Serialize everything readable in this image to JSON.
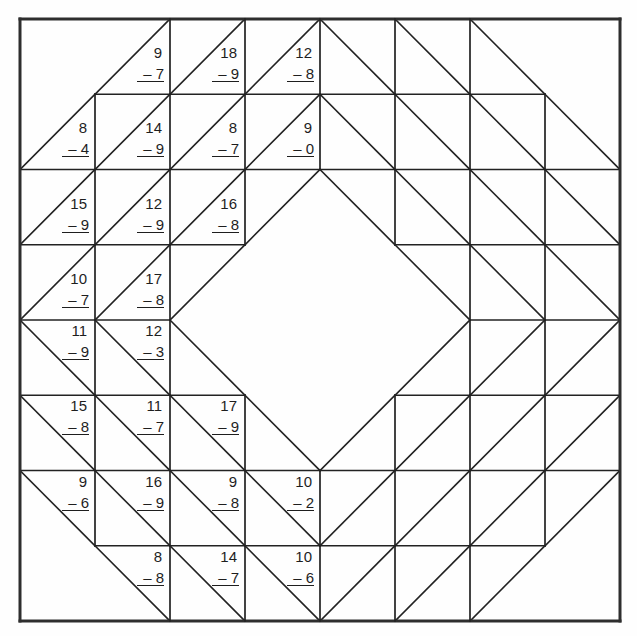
{
  "worksheet": {
    "title": "Subtraction quilt block",
    "colors": {
      "line": "#222222",
      "border": "#2e2e2e",
      "text": "#1e1e1e",
      "paper": "#fefefe"
    },
    "grid": {
      "cols": 8,
      "rows": 8,
      "origin_x": 20,
      "origin_y": 19,
      "cell_w": 75,
      "cell_h": 75.25,
      "horizontal_segments": [
        [
          0,
          0,
          8
        ],
        [
          1,
          1,
          7
        ],
        [
          2,
          0,
          8
        ],
        [
          3,
          0,
          3
        ],
        [
          3,
          5,
          8
        ],
        [
          4,
          0,
          2
        ],
        [
          4,
          6,
          8
        ],
        [
          5,
          0,
          3
        ],
        [
          5,
          5,
          8
        ],
        [
          6,
          0,
          8
        ],
        [
          7,
          1,
          7
        ],
        [
          8,
          0,
          8
        ]
      ],
      "vertical_segments": [
        [
          0,
          0,
          8
        ],
        [
          1,
          1,
          7
        ],
        [
          2,
          0,
          8
        ],
        [
          3,
          0,
          3
        ],
        [
          3,
          5,
          8
        ],
        [
          4,
          0,
          2
        ],
        [
          4,
          6,
          8
        ],
        [
          5,
          0,
          3
        ],
        [
          5,
          5,
          8
        ],
        [
          6,
          0,
          8
        ],
        [
          7,
          1,
          7
        ],
        [
          8,
          0,
          8
        ]
      ],
      "diagonals": [
        [
          "",
          "/",
          "/",
          "/",
          "\\",
          "\\",
          "\\",
          ""
        ],
        [
          "/",
          "/",
          "/",
          "/",
          "\\",
          "\\",
          "\\",
          "\\"
        ],
        [
          "/",
          "/",
          "/",
          "/",
          "\\",
          "\\",
          "\\",
          "\\"
        ],
        [
          "/",
          "/",
          "/",
          "",
          "",
          "\\",
          "\\",
          "\\"
        ],
        [
          "\\",
          "\\",
          "\\",
          "",
          "",
          "/",
          "/",
          "/"
        ],
        [
          "\\",
          "\\",
          "\\",
          "\\",
          "/",
          "/",
          "/",
          "/"
        ],
        [
          "\\",
          "\\",
          "\\",
          "\\",
          "/",
          "/",
          "/",
          "/"
        ],
        [
          "",
          "\\",
          "\\",
          "\\",
          "/",
          "/",
          "/",
          ""
        ]
      ]
    },
    "problems": [
      {
        "row": 0,
        "col": 1,
        "minuend": "9",
        "subtrahend": "– 7",
        "pos": "tl"
      },
      {
        "row": 0,
        "col": 2,
        "minuend": "18",
        "subtrahend": "– 9",
        "pos": "tl"
      },
      {
        "row": 0,
        "col": 3,
        "minuend": "12",
        "subtrahend": "– 8",
        "pos": "tl"
      },
      {
        "row": 1,
        "col": 0,
        "minuend": "8",
        "subtrahend": "– 4",
        "pos": "tl"
      },
      {
        "row": 1,
        "col": 1,
        "minuend": "14",
        "subtrahend": "– 9",
        "pos": "tl"
      },
      {
        "row": 1,
        "col": 2,
        "minuend": "8",
        "subtrahend": "– 7",
        "pos": "tl"
      },
      {
        "row": 1,
        "col": 3,
        "minuend": "9",
        "subtrahend": "– 0",
        "pos": "tl"
      },
      {
        "row": 2,
        "col": 0,
        "minuend": "15",
        "subtrahend": "– 9",
        "pos": "tl"
      },
      {
        "row": 2,
        "col": 1,
        "minuend": "12",
        "subtrahend": "– 9",
        "pos": "tl"
      },
      {
        "row": 2,
        "col": 2,
        "minuend": "16",
        "subtrahend": "– 8",
        "pos": "tl"
      },
      {
        "row": 3,
        "col": 0,
        "minuend": "10",
        "subtrahend": "– 7",
        "pos": "tl"
      },
      {
        "row": 3,
        "col": 1,
        "minuend": "17",
        "subtrahend": "– 8",
        "pos": "tl"
      },
      {
        "row": 4,
        "col": 0,
        "minuend": "11",
        "subtrahend": "– 9",
        "pos": "bl"
      },
      {
        "row": 4,
        "col": 1,
        "minuend": "12",
        "subtrahend": "– 3",
        "pos": "bl"
      },
      {
        "row": 5,
        "col": 0,
        "minuend": "15",
        "subtrahend": "– 8",
        "pos": "bl"
      },
      {
        "row": 5,
        "col": 1,
        "minuend": "11",
        "subtrahend": "– 7",
        "pos": "bl"
      },
      {
        "row": 5,
        "col": 2,
        "minuend": "17",
        "subtrahend": "– 9",
        "pos": "bl"
      },
      {
        "row": 6,
        "col": 0,
        "minuend": "9",
        "subtrahend": "– 6",
        "pos": "bl"
      },
      {
        "row": 6,
        "col": 1,
        "minuend": "16",
        "subtrahend": "– 9",
        "pos": "bl"
      },
      {
        "row": 6,
        "col": 2,
        "minuend": "9",
        "subtrahend": "– 8",
        "pos": "bl"
      },
      {
        "row": 6,
        "col": 3,
        "minuend": "10",
        "subtrahend": "– 2",
        "pos": "bl"
      },
      {
        "row": 7,
        "col": 1,
        "minuend": "8",
        "subtrahend": "– 8",
        "pos": "bl"
      },
      {
        "row": 7,
        "col": 2,
        "minuend": "14",
        "subtrahend": "– 7",
        "pos": "bl"
      },
      {
        "row": 7,
        "col": 3,
        "minuend": "10",
        "subtrahend": "– 6",
        "pos": "bl"
      }
    ]
  }
}
